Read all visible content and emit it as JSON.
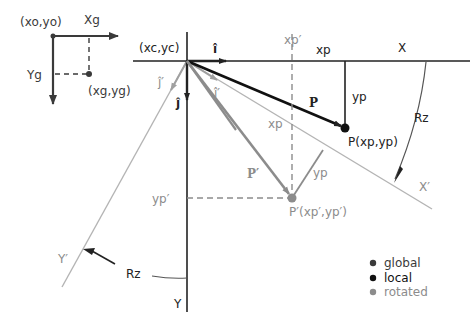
{
  "colors": {
    "global": "#3a3a3a",
    "local": "#111111",
    "rotated": "#8c8c8c",
    "rotated_light": "#b4b4b4"
  },
  "global_frame": {
    "origin_label": "(xo,yo)",
    "x_axis_label": "Xg",
    "y_axis_label": "Yg",
    "point_label": "(xg,yg)"
  },
  "local_frame": {
    "origin_label": "(xc,yc)",
    "x_axis_label": "X",
    "y_axis_label": "Y",
    "unit_i_label": "î",
    "unit_j_label": "ĵ",
    "xp_label": "xp",
    "yp_label": "yp",
    "vector_label": "P",
    "point_label": "P(xp,yp)"
  },
  "rotated_frame": {
    "x_axis_label": "X′",
    "y_axis_label": "Y′",
    "unit_i_label": "î′",
    "unit_j_label": "ĵ′",
    "xp_label": "xp",
    "yp_label": "yp",
    "xp_prime_label": "xp′",
    "yp_prime_label": "yp′",
    "vector_label": "P′",
    "point_label": "P′(xp′,yp′)"
  },
  "rotation": {
    "label_right": "Rz",
    "label_left": "Rz"
  },
  "legend": {
    "items": [
      {
        "label": "global",
        "color": "#3a3a3a"
      },
      {
        "label": "local",
        "color": "#111111"
      },
      {
        "label": "rotated",
        "color": "#8c8c8c"
      }
    ]
  }
}
